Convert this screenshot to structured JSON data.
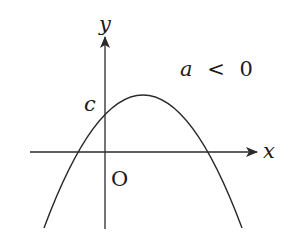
{
  "diagram": {
    "axes": {
      "x_label": "x",
      "y_label": "y",
      "origin_label": "O"
    },
    "labels": {
      "intercept": "c",
      "condition_var": "a",
      "condition_op": "<",
      "condition_value": "0",
      "condition": "a < 0"
    },
    "curve": {
      "type": "parabola",
      "opens": "downward",
      "vertex_position": "right of y-axis, above x-axis",
      "y_intercept_label": "c",
      "roots": "one negative, one positive"
    },
    "colors": {
      "stroke": "#2a2a2a",
      "background": "#ffffff"
    }
  }
}
